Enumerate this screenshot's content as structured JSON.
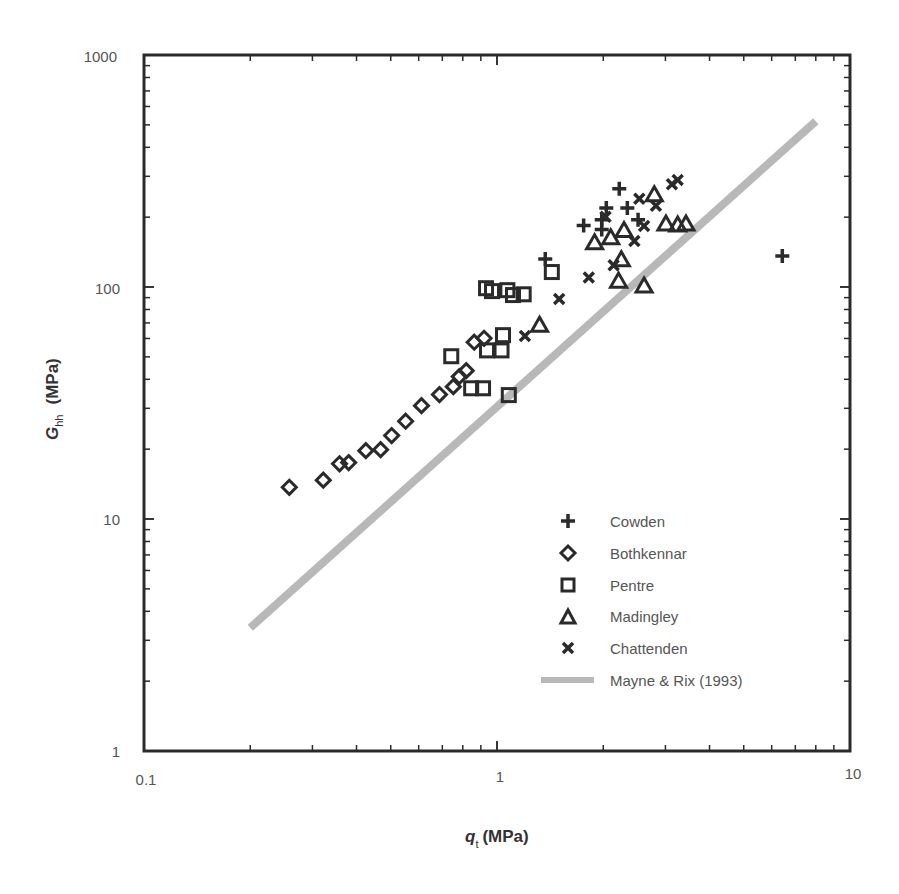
{
  "chart_data": {
    "type": "scatter",
    "title": "",
    "xlabel": "q_t (MPa)",
    "xlabel_main": "q",
    "xlabel_sub": "t",
    "xlabel_unit": "(MPa)",
    "ylabel": "G_hh (MPa)",
    "ylabel_main": "G",
    "ylabel_sub": "hh",
    "ylabel_unit": "(MPa)",
    "xscale": "log",
    "yscale": "log",
    "xlim": [
      0.1,
      10
    ],
    "ylim": [
      1,
      1000
    ],
    "x_ticks": [
      "0.1",
      "1",
      "10"
    ],
    "y_ticks": [
      "1",
      "10",
      "100",
      "1000"
    ],
    "grid": false,
    "legend_position": "lower right (inside)",
    "series": [
      {
        "name": "Cowden",
        "marker": "plus",
        "points": [
          [
            1.37,
            132
          ],
          [
            1.76,
            184
          ],
          [
            1.98,
            195
          ],
          [
            1.98,
            177
          ],
          [
            2.04,
            219
          ],
          [
            2.22,
            265
          ],
          [
            2.34,
            219
          ],
          [
            2.51,
            195
          ],
          [
            6.43,
            136
          ]
        ]
      },
      {
        "name": "Bothkennar",
        "marker": "diamond",
        "points": [
          [
            0.258,
            13.7
          ],
          [
            0.322,
            14.7
          ],
          [
            0.358,
            17.3
          ],
          [
            0.38,
            17.5
          ],
          [
            0.425,
            19.7
          ],
          [
            0.468,
            19.9
          ],
          [
            0.503,
            22.9
          ],
          [
            0.551,
            26.4
          ],
          [
            0.611,
            30.8
          ],
          [
            0.687,
            34.4
          ],
          [
            0.752,
            37.2
          ],
          [
            0.782,
            41.1
          ],
          [
            0.818,
            43.6
          ],
          [
            0.862,
            57.8
          ],
          [
            0.919,
            60.1
          ]
        ]
      },
      {
        "name": "Pentre",
        "marker": "square",
        "points": [
          [
            0.742,
            50.3
          ],
          [
            0.845,
            36.6
          ],
          [
            0.913,
            36.6
          ],
          [
            0.937,
            53.3
          ],
          [
            0.931,
            98.8
          ],
          [
            0.968,
            96.0
          ],
          [
            1.03,
            53.3
          ],
          [
            1.04,
            62.0
          ],
          [
            1.07,
            96.9
          ],
          [
            1.11,
            92.3
          ],
          [
            1.19,
            93.0
          ],
          [
            1.08,
            34.2
          ],
          [
            1.43,
            116
          ]
        ]
      },
      {
        "name": "Madingley",
        "marker": "triangle",
        "points": [
          [
            1.32,
            68.4
          ],
          [
            1.89,
            155
          ],
          [
            2.1,
            163
          ],
          [
            2.29,
            175
          ],
          [
            2.25,
            131
          ],
          [
            2.21,
            106
          ],
          [
            2.61,
            101
          ],
          [
            2.79,
            250
          ],
          [
            3.01,
            187
          ],
          [
            3.25,
            185
          ],
          [
            3.43,
            187
          ]
        ]
      },
      {
        "name": "Chattenden",
        "marker": "x",
        "points": [
          [
            1.2,
            61.5
          ],
          [
            1.5,
            88.8
          ],
          [
            1.82,
            110
          ],
          [
            2.03,
            201
          ],
          [
            2.14,
            124
          ],
          [
            2.45,
            158
          ],
          [
            2.53,
            240
          ],
          [
            2.61,
            183
          ],
          [
            2.82,
            224
          ],
          [
            3.13,
            277
          ],
          [
            3.25,
            289
          ]
        ]
      },
      {
        "name": "Mayne & Rix (1993)",
        "marker": "line",
        "color": "#b8b8b8",
        "points": [
          [
            0.2,
            3.4
          ],
          [
            8.0,
            518
          ]
        ]
      }
    ]
  },
  "legend": {
    "items": [
      {
        "label": "Cowden",
        "marker": "plus"
      },
      {
        "label": "Bothkennar",
        "marker": "diamond"
      },
      {
        "label": "Pentre",
        "marker": "square"
      },
      {
        "label": "Madingley",
        "marker": "triangle"
      },
      {
        "label": "Chattenden",
        "marker": "x"
      },
      {
        "label": "Mayne & Rix (1993)",
        "marker": "line"
      }
    ]
  },
  "colors": {
    "marker": "#2a2a2a",
    "frame": "#2a2a2a",
    "trend_line": "#b8b8b8",
    "text": "#555555"
  }
}
